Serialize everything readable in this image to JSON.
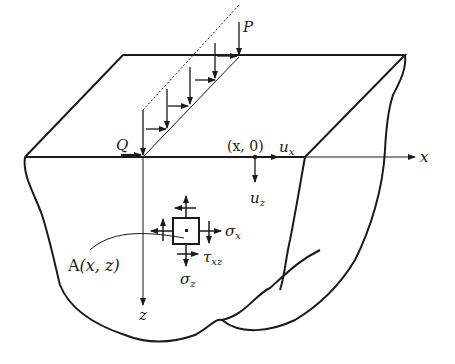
{
  "figure": {
    "colors": {
      "ink": "#1a1a1a",
      "background": "#ffffff"
    },
    "labels": {
      "P": "P",
      "Q": "Q",
      "surface_point": "(x, 0)",
      "ux": "u",
      "ux_sub": "x",
      "uz": "u",
      "uz_sub": "z",
      "x_axis": "x",
      "z_axis": "z",
      "point_A": "A",
      "point_A_coords": "(x, z)",
      "sigma_x": "σ",
      "sigma_x_sub": "x",
      "sigma_z": "σ",
      "sigma_z_sub": "z",
      "tau_xz": "τ",
      "tau_xz_sub": "xz"
    }
  }
}
